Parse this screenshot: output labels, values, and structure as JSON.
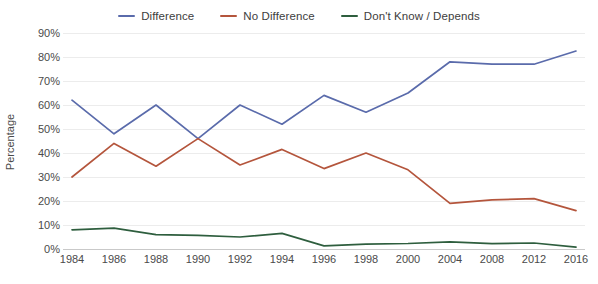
{
  "chart_data": {
    "type": "line",
    "title": "",
    "xlabel": "",
    "ylabel": "Percentage",
    "ylim": [
      0,
      90
    ],
    "ytick_step": 10,
    "grid": true,
    "legend_position": "top-center",
    "categories": [
      "1984",
      "1986",
      "1988",
      "1990",
      "1992",
      "1994",
      "1996",
      "1998",
      "2000",
      "2004",
      "2008",
      "2012",
      "2016"
    ],
    "ytick_labels": [
      "90%",
      "80%",
      "70%",
      "60%",
      "50%",
      "40%",
      "30%",
      "20%",
      "10%",
      "0%"
    ],
    "series": [
      {
        "name": "Difference",
        "color": "#5a6bab",
        "values": [
          62,
          48,
          60,
          46,
          60,
          52,
          64,
          57,
          65,
          78,
          77,
          77,
          82.5
        ]
      },
      {
        "name": "No Difference",
        "color": "#b4553c",
        "values": [
          30,
          44,
          34.5,
          46,
          35,
          41.5,
          33.5,
          40,
          33,
          19,
          20.5,
          21,
          16
        ]
      },
      {
        "name": "Don't Know / Depends",
        "color": "#2e5e3e",
        "values": [
          8,
          8.7,
          6,
          5.7,
          5,
          6.5,
          1.3,
          2,
          2.3,
          3,
          2.2,
          2.5,
          0.8
        ]
      }
    ]
  },
  "legend": {
    "items": [
      {
        "label": "Difference",
        "swatch_name": "legend-swatch-difference"
      },
      {
        "label": "No Difference",
        "swatch_name": "legend-swatch-no-difference"
      },
      {
        "label": "Don't Know / Depends",
        "swatch_name": "legend-swatch-dont-know"
      }
    ]
  },
  "axes": {
    "y_title": "Percentage"
  }
}
